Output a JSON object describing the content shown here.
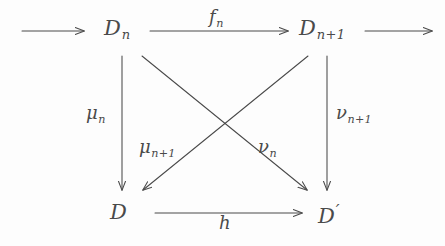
{
  "diagram": {
    "type": "commutative-diagram",
    "background_color": "#fdfdfd",
    "ink_color": "#4a4a4a",
    "nodes": [
      {
        "id": "D_n",
        "base": "D",
        "sub": "n",
        "prime": "",
        "x": 122,
        "y": 30
      },
      {
        "id": "D_n+1",
        "base": "D",
        "sub": "n+1",
        "prime": "",
        "x": 327,
        "y": 30
      },
      {
        "id": "D",
        "base": "D",
        "sub": "",
        "prime": "",
        "x": 122,
        "y": 214
      },
      {
        "id": "D_prime",
        "base": "D",
        "sub": "",
        "prime": "'",
        "x": 327,
        "y": 214
      }
    ],
    "edges": [
      {
        "id": "incoming",
        "from": "",
        "to": "D_n",
        "label_base": "",
        "label_sub": "",
        "style": "horizontal-arrow",
        "labelled": false
      },
      {
        "id": "f_n",
        "from": "D_n",
        "to": "D_n+1",
        "label_base": "f",
        "label_sub": "n",
        "style": "horizontal-arrow",
        "labelled": true
      },
      {
        "id": "outgoing",
        "from": "D_n+1",
        "to": "",
        "label_base": "",
        "label_sub": "",
        "style": "horizontal-arrow",
        "labelled": false
      },
      {
        "id": "mu_n",
        "from": "D_n",
        "to": "D",
        "label_base": "μ",
        "label_sub": "n",
        "style": "vertical-arrow",
        "labelled": true
      },
      {
        "id": "nu_n+1",
        "from": "D_n+1",
        "to": "D_prime",
        "label_base": "ν",
        "label_sub": "n+1",
        "style": "vertical-arrow",
        "labelled": true
      },
      {
        "id": "mu_n+1",
        "from": "D_n+1",
        "to": "D",
        "label_base": "μ",
        "label_sub": "n+1",
        "style": "diagonal-arrow",
        "labelled": true
      },
      {
        "id": "nu_n",
        "from": "D_n",
        "to": "D_prime",
        "label_base": "ν",
        "label_sub": "n",
        "style": "diagonal-arrow",
        "labelled": true
      },
      {
        "id": "h",
        "from": "D",
        "to": "D_prime",
        "label_base": "h",
        "label_sub": "",
        "style": "horizontal-arrow",
        "labelled": true
      }
    ]
  },
  "nodes": {
    "top_left": {
      "base": "D",
      "sub": "n",
      "prime": ""
    },
    "top_right": {
      "base": "D",
      "sub": "n+1",
      "prime": ""
    },
    "bottom_left": {
      "base": "D",
      "sub": "",
      "prime": ""
    },
    "bottom_right": {
      "base": "D",
      "sub": "",
      "prime": "′"
    }
  },
  "labels": {
    "f_n": {
      "base": "f",
      "sub": "n"
    },
    "mu_n": {
      "base": "μ",
      "sub": "n"
    },
    "nu_n1": {
      "base": "ν",
      "sub": "n+1"
    },
    "mu_n1": {
      "base": "μ",
      "sub": "n+1"
    },
    "nu_n": {
      "base": "ν",
      "sub": "n"
    },
    "h": {
      "base": "h",
      "sub": ""
    }
  }
}
